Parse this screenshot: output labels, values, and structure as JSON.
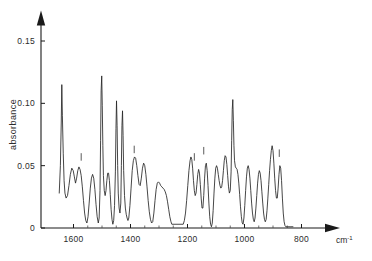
{
  "chart_data": {
    "type": "line",
    "title": "",
    "xlabel": "cm-1",
    "ylabel": "absorbance",
    "x_unit": "cm⁻¹",
    "x_unit_base": "cm",
    "x_unit_exp": "-1",
    "xlim": [
      1650,
      780
    ],
    "ylim": [
      0,
      0.168
    ],
    "x_axis_reversed": true,
    "grid": false,
    "legend": null,
    "xticks": [
      1600,
      1400,
      1200,
      1000,
      800
    ],
    "xtick_labels": [
      "1600",
      "1400",
      "1200",
      "1000",
      "800"
    ],
    "yticks": [
      0,
      0.05,
      0.1,
      0.15
    ],
    "ytick_labels": [
      "0",
      "0.05",
      "0.10",
      "0.15"
    ],
    "gap_range": [
      1255,
      1215
    ],
    "annotation_markers": [
      {
        "x": 1573,
        "y": 0.052
      },
      {
        "x": 1387,
        "y": 0.058
      },
      {
        "x": 1176,
        "y": 0.052
      },
      {
        "x": 1143,
        "y": 0.057
      },
      {
        "x": 878,
        "y": 0.055
      }
    ],
    "series": [
      {
        "name": "absorbance",
        "points": [
          [
            1650,
            0.028
          ],
          [
            1646,
            0.05
          ],
          [
            1643,
            0.085
          ],
          [
            1641,
            0.115
          ],
          [
            1639,
            0.09
          ],
          [
            1636,
            0.06
          ],
          [
            1633,
            0.038
          ],
          [
            1630,
            0.028
          ],
          [
            1626,
            0.024
          ],
          [
            1621,
            0.026
          ],
          [
            1616,
            0.034
          ],
          [
            1611,
            0.043
          ],
          [
            1606,
            0.048
          ],
          [
            1601,
            0.046
          ],
          [
            1597,
            0.041
          ],
          [
            1593,
            0.036
          ],
          [
            1589,
            0.04
          ],
          [
            1585,
            0.046
          ],
          [
            1581,
            0.049
          ],
          [
            1577,
            0.047
          ],
          [
            1573,
            0.042
          ],
          [
            1569,
            0.033
          ],
          [
            1565,
            0.022
          ],
          [
            1561,
            0.012
          ],
          [
            1557,
            0.006
          ],
          [
            1553,
            0.004
          ],
          [
            1549,
            0.009
          ],
          [
            1545,
            0.02
          ],
          [
            1541,
            0.032
          ],
          [
            1537,
            0.04
          ],
          [
            1533,
            0.043
          ],
          [
            1529,
            0.04
          ],
          [
            1525,
            0.031
          ],
          [
            1521,
            0.019
          ],
          [
            1517,
            0.009
          ],
          [
            1513,
            0.004
          ],
          [
            1510,
            0.008
          ],
          [
            1507,
            0.03
          ],
          [
            1505,
            0.07
          ],
          [
            1503,
            0.11
          ],
          [
            1501,
            0.122
          ],
          [
            1499,
            0.098
          ],
          [
            1497,
            0.066
          ],
          [
            1495,
            0.042
          ],
          [
            1492,
            0.03
          ],
          [
            1489,
            0.026
          ],
          [
            1486,
            0.03
          ],
          [
            1483,
            0.038
          ],
          [
            1480,
            0.044
          ],
          [
            1477,
            0.044
          ],
          [
            1474,
            0.038
          ],
          [
            1471,
            0.027
          ],
          [
            1468,
            0.015
          ],
          [
            1465,
            0.007
          ],
          [
            1462,
            0.003
          ],
          [
            1459,
            0.006
          ],
          [
            1456,
            0.018
          ],
          [
            1453,
            0.045
          ],
          [
            1451,
            0.08
          ],
          [
            1449,
            0.102
          ],
          [
            1447,
            0.082
          ],
          [
            1445,
            0.05
          ],
          [
            1443,
            0.028
          ],
          [
            1440,
            0.016
          ],
          [
            1437,
            0.012
          ],
          [
            1434,
            0.02
          ],
          [
            1432,
            0.05
          ],
          [
            1430,
            0.082
          ],
          [
            1428,
            0.094
          ],
          [
            1426,
            0.074
          ],
          [
            1424,
            0.046
          ],
          [
            1421,
            0.026
          ],
          [
            1418,
            0.016
          ],
          [
            1415,
            0.011
          ],
          [
            1412,
            0.008
          ],
          [
            1409,
            0.006
          ],
          [
            1406,
            0.008
          ],
          [
            1402,
            0.018
          ],
          [
            1398,
            0.032
          ],
          [
            1394,
            0.046
          ],
          [
            1390,
            0.054
          ],
          [
            1386,
            0.057
          ],
          [
            1382,
            0.056
          ],
          [
            1378,
            0.05
          ],
          [
            1374,
            0.042
          ],
          [
            1370,
            0.035
          ],
          [
            1366,
            0.034
          ],
          [
            1362,
            0.04
          ],
          [
            1358,
            0.048
          ],
          [
            1354,
            0.052
          ],
          [
            1350,
            0.05
          ],
          [
            1346,
            0.043
          ],
          [
            1342,
            0.033
          ],
          [
            1338,
            0.022
          ],
          [
            1334,
            0.013
          ],
          [
            1330,
            0.007
          ],
          [
            1326,
            0.004
          ],
          [
            1322,
            0.005
          ],
          [
            1318,
            0.012
          ],
          [
            1314,
            0.022
          ],
          [
            1310,
            0.031
          ],
          [
            1306,
            0.036
          ],
          [
            1302,
            0.037
          ],
          [
            1298,
            0.036
          ],
          [
            1294,
            0.034
          ],
          [
            1290,
            0.033
          ],
          [
            1286,
            0.032
          ],
          [
            1282,
            0.031
          ],
          [
            1278,
            0.029
          ],
          [
            1274,
            0.026
          ],
          [
            1270,
            0.021
          ],
          [
            1266,
            0.015
          ],
          [
            1262,
            0.009
          ],
          [
            1258,
            0.005
          ],
          [
            1255,
            0.003
          ],
          [
            1215,
            0.003
          ],
          [
            1211,
            0.006
          ],
          [
            1207,
            0.012
          ],
          [
            1203,
            0.022
          ],
          [
            1199,
            0.034
          ],
          [
            1195,
            0.046
          ],
          [
            1191,
            0.054
          ],
          [
            1188,
            0.057
          ],
          [
            1185,
            0.055
          ],
          [
            1182,
            0.048
          ],
          [
            1179,
            0.038
          ],
          [
            1176,
            0.03
          ],
          [
            1173,
            0.026
          ],
          [
            1170,
            0.028
          ],
          [
            1167,
            0.035
          ],
          [
            1164,
            0.043
          ],
          [
            1161,
            0.047
          ],
          [
            1158,
            0.044
          ],
          [
            1155,
            0.035
          ],
          [
            1152,
            0.024
          ],
          [
            1149,
            0.016
          ],
          [
            1146,
            0.016
          ],
          [
            1143,
            0.026
          ],
          [
            1140,
            0.04
          ],
          [
            1137,
            0.05
          ],
          [
            1134,
            0.052
          ],
          [
            1131,
            0.046
          ],
          [
            1128,
            0.034
          ],
          [
            1125,
            0.02
          ],
          [
            1122,
            0.009
          ],
          [
            1119,
            0.003
          ],
          [
            1116,
            0.001
          ],
          [
            1113,
            0.004
          ],
          [
            1110,
            0.014
          ],
          [
            1107,
            0.028
          ],
          [
            1104,
            0.04
          ],
          [
            1101,
            0.048
          ],
          [
            1098,
            0.05
          ],
          [
            1095,
            0.048
          ],
          [
            1092,
            0.043
          ],
          [
            1089,
            0.038
          ],
          [
            1086,
            0.034
          ],
          [
            1083,
            0.032
          ],
          [
            1080,
            0.033
          ],
          [
            1077,
            0.038
          ],
          [
            1074,
            0.046
          ],
          [
            1071,
            0.054
          ],
          [
            1068,
            0.058
          ],
          [
            1065,
            0.057
          ],
          [
            1062,
            0.051
          ],
          [
            1059,
            0.042
          ],
          [
            1056,
            0.033
          ],
          [
            1053,
            0.028
          ],
          [
            1050,
            0.03
          ],
          [
            1047,
            0.045
          ],
          [
            1045,
            0.07
          ],
          [
            1043,
            0.095
          ],
          [
            1041,
            0.103
          ],
          [
            1039,
            0.086
          ],
          [
            1037,
            0.066
          ],
          [
            1035,
            0.054
          ],
          [
            1032,
            0.049
          ],
          [
            1029,
            0.048
          ],
          [
            1026,
            0.047
          ],
          [
            1023,
            0.043
          ],
          [
            1020,
            0.036
          ],
          [
            1017,
            0.027
          ],
          [
            1014,
            0.017
          ],
          [
            1011,
            0.009
          ],
          [
            1008,
            0.004
          ],
          [
            1005,
            0.003
          ],
          [
            1002,
            0.008
          ],
          [
            999,
            0.018
          ],
          [
            996,
            0.03
          ],
          [
            993,
            0.041
          ],
          [
            990,
            0.048
          ],
          [
            987,
            0.05
          ],
          [
            984,
            0.047
          ],
          [
            981,
            0.04
          ],
          [
            978,
            0.03
          ],
          [
            975,
            0.02
          ],
          [
            972,
            0.012
          ],
          [
            969,
            0.007
          ],
          [
            966,
            0.005
          ],
          [
            963,
            0.008
          ],
          [
            960,
            0.016
          ],
          [
            957,
            0.026
          ],
          [
            954,
            0.036
          ],
          [
            951,
            0.043
          ],
          [
            948,
            0.046
          ],
          [
            945,
            0.044
          ],
          [
            942,
            0.038
          ],
          [
            939,
            0.029
          ],
          [
            936,
            0.02
          ],
          [
            933,
            0.012
          ],
          [
            930,
            0.007
          ],
          [
            927,
            0.005
          ],
          [
            924,
            0.007
          ],
          [
            921,
            0.014
          ],
          [
            918,
            0.024
          ],
          [
            915,
            0.035
          ],
          [
            912,
            0.046
          ],
          [
            909,
            0.055
          ],
          [
            906,
            0.062
          ],
          [
            903,
            0.066
          ],
          [
            900,
            0.062
          ],
          [
            897,
            0.052
          ],
          [
            894,
            0.04
          ],
          [
            891,
            0.03
          ],
          [
            888,
            0.024
          ],
          [
            885,
            0.024
          ],
          [
            882,
            0.032
          ],
          [
            879,
            0.043
          ],
          [
            876,
            0.05
          ],
          [
            873,
            0.048
          ],
          [
            870,
            0.038
          ],
          [
            867,
            0.024
          ],
          [
            864,
            0.012
          ],
          [
            861,
            0.005
          ],
          [
            858,
            0.002
          ],
          [
            855,
            0.001
          ],
          [
            850,
            0.001
          ],
          [
            840,
            0.001
          ],
          [
            830,
            0.001
          ]
        ]
      }
    ]
  },
  "axes": {
    "y_axis_title": "absorbance",
    "x_unit_text": "cm",
    "x_unit_sup": "-1"
  }
}
